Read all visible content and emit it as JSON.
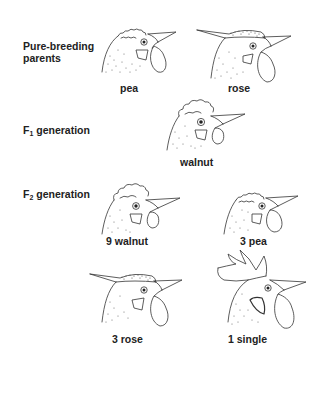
{
  "figure": {
    "rows": [
      {
        "id": "parents",
        "label_line1": "Pure-breeding",
        "label_line2": "parents"
      },
      {
        "id": "f1",
        "label_prefix": "F",
        "label_sub": "1",
        "label_suffix": " generation"
      },
      {
        "id": "f2",
        "label_prefix": "F",
        "label_sub": "2",
        "label_suffix": " generation"
      }
    ],
    "heads": [
      {
        "id": "pea-parent",
        "comb": "pea",
        "caption": "pea"
      },
      {
        "id": "rose-parent",
        "comb": "rose",
        "caption": "rose"
      },
      {
        "id": "walnut-f1",
        "comb": "walnut",
        "caption": "walnut"
      },
      {
        "id": "walnut-f2",
        "comb": "walnut",
        "caption": "9 walnut"
      },
      {
        "id": "pea-f2",
        "comb": "pea",
        "caption": "3 pea"
      },
      {
        "id": "rose-f2",
        "comb": "rose",
        "caption": "3 rose"
      },
      {
        "id": "single-f2",
        "comb": "single",
        "caption": "1 single"
      }
    ],
    "ratio": "9:3:3:1"
  }
}
